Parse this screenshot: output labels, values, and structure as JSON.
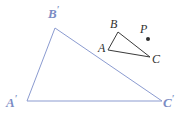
{
  "figure": {
    "kind": "geometry-diagram",
    "background_color": "#ffffff",
    "width": 182,
    "height": 118,
    "image_triangle": {
      "name": "triangle-A-prime-B-prime-C-prime",
      "stroke_color": "#8b9bd0",
      "stroke_width": 1,
      "fill": "none",
      "vertices": [
        {
          "label": "A",
          "prime": "′",
          "x": 27,
          "y": 101
        },
        {
          "label": "B",
          "prime": "′",
          "x": 55,
          "y": 28
        },
        {
          "label": "C",
          "prime": "′",
          "x": 162,
          "y": 101
        }
      ],
      "labels": {
        "a": "A",
        "b": "B",
        "c": "C",
        "prime": "′"
      }
    },
    "preimage_triangle": {
      "name": "triangle-A-B-C",
      "stroke_color": "#3a3a3a",
      "stroke_width": 1,
      "fill": "none",
      "vertices": [
        {
          "label": "A",
          "x": 108,
          "y": 50
        },
        {
          "label": "B",
          "x": 118,
          "y": 32
        },
        {
          "label": "C",
          "x": 150,
          "y": 57
        }
      ],
      "labels": {
        "a": "A",
        "b": "B",
        "c": "C"
      }
    },
    "center_point": {
      "name": "point-P",
      "label": "P",
      "color": "#2f2f2f",
      "dot_x": 148,
      "dot_y": 39,
      "dot_radius": 2
    }
  }
}
